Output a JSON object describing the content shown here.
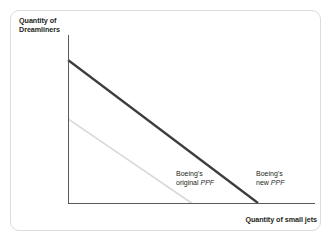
{
  "figure": {
    "background_color": "#ffffff",
    "border_color": "#dcdcdc"
  },
  "axes": {
    "y_label": "Quantity of\nDreamliners",
    "x_label": "Quantity of small jets",
    "axis_color": "#58595b"
  },
  "annotations": {
    "original": {
      "line1": "Boeing's",
      "line2_prefix": "original ",
      "line2_italic": "PPF"
    },
    "new": {
      "line1": "Boeing's",
      "line2_prefix": "new ",
      "line2_italic": "PPF"
    }
  },
  "chart_data": {
    "type": "line",
    "title": "",
    "xlabel": "Quantity of small jets",
    "ylabel": "Quantity of Dreamliners",
    "xlim": [
      0,
      100
    ],
    "ylim": [
      0,
      100
    ],
    "grid": false,
    "legend": "inline-annotations",
    "axis_ticks": [],
    "series": [
      {
        "name": "Boeing's original PPF",
        "color": "#d9d9d9",
        "linewidth": 1.6,
        "x": [
          0,
          65
        ],
        "y": [
          50,
          0
        ],
        "intercepts": {
          "y_intercept": 50,
          "x_intercept": 65
        }
      },
      {
        "name": "Boeing's new PPF",
        "color": "#3c3c3c",
        "linewidth": 2.2,
        "x": [
          0,
          100
        ],
        "y": [
          85,
          0
        ],
        "intercepts": {
          "y_intercept": 85,
          "x_intercept": 100
        }
      }
    ]
  }
}
